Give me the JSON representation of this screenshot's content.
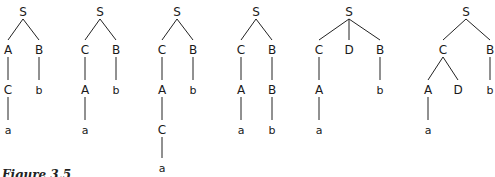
{
  "caption": "Figure 3.5",
  "trees": [
    {
      "nodes": [
        {
          "id": "S",
          "label": "S",
          "x": 23,
          "y": 12
        },
        {
          "id": "A",
          "label": "A",
          "x": 8,
          "y": 50
        },
        {
          "id": "B",
          "label": "B",
          "x": 39,
          "y": 50
        },
        {
          "id": "C",
          "label": "C",
          "x": 8,
          "y": 90
        },
        {
          "id": "b",
          "label": "b",
          "x": 39,
          "y": 90,
          "leaf": true
        },
        {
          "id": "a",
          "label": "a",
          "x": 8,
          "y": 130,
          "leaf": true
        }
      ],
      "edges": [
        [
          "S",
          "A"
        ],
        [
          "S",
          "B"
        ],
        [
          "A",
          "C"
        ],
        [
          "B",
          "b"
        ],
        [
          "C",
          "a"
        ]
      ]
    },
    {
      "nodes": [
        {
          "id": "S",
          "label": "S",
          "x": 100,
          "y": 12
        },
        {
          "id": "C",
          "label": "C",
          "x": 85,
          "y": 50
        },
        {
          "id": "B",
          "label": "B",
          "x": 116,
          "y": 50
        },
        {
          "id": "A",
          "label": "A",
          "x": 85,
          "y": 90
        },
        {
          "id": "b",
          "label": "b",
          "x": 116,
          "y": 90,
          "leaf": true
        },
        {
          "id": "a",
          "label": "a",
          "x": 85,
          "y": 130,
          "leaf": true
        }
      ],
      "edges": [
        [
          "S",
          "C"
        ],
        [
          "S",
          "B"
        ],
        [
          "C",
          "A"
        ],
        [
          "B",
          "b"
        ],
        [
          "A",
          "a"
        ]
      ]
    },
    {
      "nodes": [
        {
          "id": "S",
          "label": "S",
          "x": 177,
          "y": 12
        },
        {
          "id": "C",
          "label": "C",
          "x": 162,
          "y": 50
        },
        {
          "id": "B",
          "label": "B",
          "x": 193,
          "y": 50
        },
        {
          "id": "A",
          "label": "A",
          "x": 162,
          "y": 90
        },
        {
          "id": "b",
          "label": "b",
          "x": 193,
          "y": 90,
          "leaf": true
        },
        {
          "id": "C2",
          "label": "C",
          "x": 162,
          "y": 130
        },
        {
          "id": "a",
          "label": "a",
          "x": 162,
          "y": 168,
          "leaf": true
        }
      ],
      "edges": [
        [
          "S",
          "C"
        ],
        [
          "S",
          "B"
        ],
        [
          "C",
          "A"
        ],
        [
          "B",
          "b"
        ],
        [
          "A",
          "C2"
        ],
        [
          "C2",
          "a"
        ]
      ]
    },
    {
      "nodes": [
        {
          "id": "S",
          "label": "S",
          "x": 256,
          "y": 12
        },
        {
          "id": "C",
          "label": "C",
          "x": 241,
          "y": 50
        },
        {
          "id": "B",
          "label": "B",
          "x": 272,
          "y": 50
        },
        {
          "id": "A",
          "label": "A",
          "x": 241,
          "y": 90
        },
        {
          "id": "B2",
          "label": "B",
          "x": 272,
          "y": 90
        },
        {
          "id": "a",
          "label": "a",
          "x": 241,
          "y": 130,
          "leaf": true
        },
        {
          "id": "b",
          "label": "b",
          "x": 272,
          "y": 130,
          "leaf": true
        }
      ],
      "edges": [
        [
          "S",
          "C"
        ],
        [
          "S",
          "B"
        ],
        [
          "C",
          "A"
        ],
        [
          "B",
          "B2"
        ],
        [
          "A",
          "a"
        ],
        [
          "B2",
          "b"
        ]
      ]
    },
    {
      "nodes": [
        {
          "id": "S",
          "label": "S",
          "x": 349,
          "y": 12
        },
        {
          "id": "C",
          "label": "C",
          "x": 319,
          "y": 50
        },
        {
          "id": "D",
          "label": "D",
          "x": 349,
          "y": 50
        },
        {
          "id": "B",
          "label": "B",
          "x": 380,
          "y": 50
        },
        {
          "id": "A",
          "label": "A",
          "x": 319,
          "y": 90
        },
        {
          "id": "b",
          "label": "b",
          "x": 380,
          "y": 90,
          "leaf": true
        },
        {
          "id": "a",
          "label": "a",
          "x": 319,
          "y": 130,
          "leaf": true
        }
      ],
      "edges": [
        [
          "S",
          "C"
        ],
        [
          "S",
          "D"
        ],
        [
          "S",
          "B"
        ],
        [
          "C",
          "A"
        ],
        [
          "B",
          "b"
        ],
        [
          "A",
          "a"
        ]
      ]
    },
    {
      "nodes": [
        {
          "id": "S",
          "label": "S",
          "x": 466,
          "y": 12
        },
        {
          "id": "C",
          "label": "C",
          "x": 443,
          "y": 50
        },
        {
          "id": "B",
          "label": "B",
          "x": 490,
          "y": 50
        },
        {
          "id": "A",
          "label": "A",
          "x": 428,
          "y": 90
        },
        {
          "id": "D",
          "label": "D",
          "x": 458,
          "y": 90
        },
        {
          "id": "b",
          "label": "b",
          "x": 490,
          "y": 90,
          "leaf": true
        },
        {
          "id": "a",
          "label": "a",
          "x": 428,
          "y": 130,
          "leaf": true
        }
      ],
      "edges": [
        [
          "S",
          "C"
        ],
        [
          "S",
          "B"
        ],
        [
          "C",
          "A"
        ],
        [
          "C",
          "D"
        ],
        [
          "B",
          "b"
        ],
        [
          "A",
          "a"
        ]
      ]
    }
  ]
}
